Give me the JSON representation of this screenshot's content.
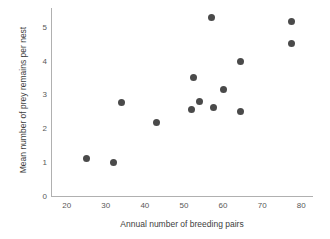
{
  "chart_data": {
    "type": "scatter",
    "title": "",
    "xlabel": "Annual number of breeding pairs",
    "ylabel": "Mean number of prey remains per nest",
    "xlim": [
      16,
      83
    ],
    "ylim": [
      0,
      5.55
    ],
    "xticks": [
      20,
      30,
      40,
      50,
      60,
      70,
      80
    ],
    "yticks": [
      0,
      1,
      2,
      3,
      4,
      5
    ],
    "xtick_labels": [
      "20",
      "30",
      "40",
      "50",
      "60",
      "70",
      "80"
    ],
    "ytick_labels": [
      "0",
      "1",
      "2",
      "3",
      "4",
      "5"
    ],
    "grid": false,
    "legend": false,
    "marker_color": "#4a4a4a",
    "axis_color": "#b0b0b0",
    "points": [
      {
        "x": 25,
        "y": 1.1
      },
      {
        "x": 32,
        "y": 1.0
      },
      {
        "x": 34,
        "y": 2.75
      },
      {
        "x": 43,
        "y": 2.17
      },
      {
        "x": 52,
        "y": 2.55
      },
      {
        "x": 52.5,
        "y": 3.5
      },
      {
        "x": 54,
        "y": 2.8
      },
      {
        "x": 57,
        "y": 5.27
      },
      {
        "x": 57.5,
        "y": 2.6
      },
      {
        "x": 60,
        "y": 3.13
      },
      {
        "x": 64.5,
        "y": 3.97
      },
      {
        "x": 64.5,
        "y": 2.48
      },
      {
        "x": 77.5,
        "y": 5.15
      },
      {
        "x": 77.5,
        "y": 4.5
      }
    ]
  }
}
